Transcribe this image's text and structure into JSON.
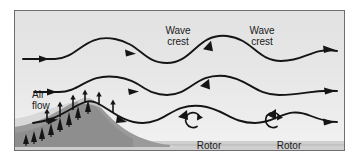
{
  "figure": {
    "title_alt": "Mountain wave airflow diagram",
    "background_color": "#e6e6e6",
    "border_color": "#6e6e6e",
    "ground_color": "#cfcfcf",
    "mountain_color": "#9a9a9a",
    "mist_color": "#d4d4d4",
    "tree_color": "#1a1a1a",
    "line_color": "#1a1a1a"
  },
  "labels": {
    "wave_crest_1": "Wave\ncrest",
    "wave_crest_2": "Wave\ncrest",
    "air_flow": "Air\nflow",
    "rotor_1": "Rotor",
    "rotor_2": "Rotor"
  },
  "diagram_data": {
    "type": "diagram",
    "subject": "mountain lee wave airflow",
    "streamline_count": 3,
    "streamlines": [
      {
        "name": "upper-streamline",
        "arrowheads": 4,
        "crest_count": 3,
        "baseline_y": 56
      },
      {
        "name": "middle-streamline",
        "arrowheads": 4,
        "crest_count": 3,
        "baseline_y": 89
      },
      {
        "name": "lower-streamline",
        "arrowheads": 4,
        "crest_count": 3,
        "baseline_y": 121
      }
    ],
    "rotors": [
      {
        "name": "rotor-1",
        "cx": 194,
        "cy": 119,
        "rotation": "counterclockwise"
      },
      {
        "name": "rotor-2",
        "cx": 274,
        "cy": 119,
        "rotation": "counterclockwise"
      }
    ],
    "mountain": {
      "name": "mountain",
      "peak_x": 78,
      "peak_y": 117,
      "left_base_x": 14,
      "right_base_x": 160,
      "base_y": 146
    },
    "updraft_arrows": 6,
    "trees": 11,
    "annotations": [
      "Wave crest",
      "Wave crest",
      "Air flow",
      "Rotor",
      "Rotor"
    ]
  }
}
